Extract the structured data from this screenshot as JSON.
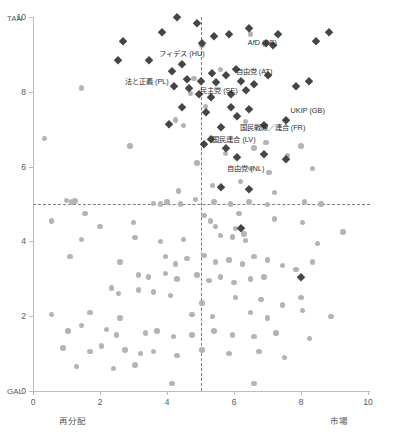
{
  "chart_data": {
    "type": "scatter",
    "title": "",
    "xlabel": "",
    "ylabel": "",
    "xlim": [
      0,
      10
    ],
    "ylim": [
      0,
      10
    ],
    "grid": false,
    "legend": "none",
    "axis_pole_labels": {
      "y_top": "TAN",
      "y_bottom": "GAL",
      "x_left": "再分配",
      "x_right": "市場"
    },
    "x_ticks": [
      "0",
      "2",
      "4",
      "6",
      "8",
      "10"
    ],
    "x_tick_values": [
      0,
      2,
      4,
      6,
      8,
      10
    ],
    "y_ticks": [
      "0",
      "2",
      "4",
      "6",
      "8",
      "10"
    ],
    "y_tick_values": [
      0,
      2,
      4,
      6,
      8,
      10
    ],
    "reference_lines": [
      {
        "orientation": "horizontal",
        "value": 5,
        "style": "dashed"
      },
      {
        "orientation": "vertical",
        "value": 5,
        "style": "dashed"
      }
    ],
    "colors": {
      "highlight_marker": "#454545",
      "background_marker": "#b4b4b4",
      "axis": "#bdbdbd",
      "reference_line": "#7d7d7d",
      "text": "#575757"
    },
    "series": [
      {
        "name": "背景政党",
        "marker": "circle",
        "color": "#b4b4b4",
        "points": [
          [
            0.35,
            6.75
          ],
          [
            1.45,
            8.1
          ],
          [
            5.05,
            9.25
          ],
          [
            6.5,
            9.55
          ],
          [
            4.8,
            8.35
          ],
          [
            4.7,
            7.95
          ],
          [
            5.6,
            8.6
          ],
          [
            5.15,
            7.6
          ],
          [
            4.25,
            7.25
          ],
          [
            4.5,
            7.1
          ],
          [
            6.35,
            7.2
          ],
          [
            6.95,
            6.65
          ],
          [
            6.6,
            6.5
          ],
          [
            5.75,
            6.35
          ],
          [
            4.9,
            6.1
          ],
          [
            6.5,
            5.95
          ],
          [
            7.05,
            5.85
          ],
          [
            6.2,
            5.6
          ],
          [
            5.35,
            5.5
          ],
          [
            7.6,
            6.3
          ],
          [
            8.0,
            6.55
          ],
          [
            8.35,
            5.95
          ],
          [
            7.2,
            5.3
          ],
          [
            1.0,
            5.1
          ],
          [
            1.15,
            5.05
          ],
          [
            1.25,
            5.08
          ],
          [
            3.6,
            5.02
          ],
          [
            3.8,
            5.0
          ],
          [
            4.0,
            5.05
          ],
          [
            4.4,
            5.0
          ],
          [
            4.85,
            5.12
          ],
          [
            5.4,
            5.05
          ],
          [
            5.9,
            5.0
          ],
          [
            6.45,
            5.05
          ],
          [
            7.0,
            4.98
          ],
          [
            8.1,
            5.05
          ],
          [
            8.6,
            5.0
          ],
          [
            1.55,
            4.75
          ],
          [
            0.55,
            4.55
          ],
          [
            2.0,
            4.4
          ],
          [
            3.0,
            4.5
          ],
          [
            5.1,
            4.7
          ],
          [
            5.3,
            4.55
          ],
          [
            5.45,
            4.4
          ],
          [
            6.15,
            4.75
          ],
          [
            6.05,
            4.35
          ],
          [
            6.3,
            4.2
          ],
          [
            7.2,
            4.6
          ],
          [
            8.05,
            4.5
          ],
          [
            1.45,
            4.05
          ],
          [
            3.8,
            4.0
          ],
          [
            4.5,
            4.05
          ],
          [
            5.6,
            4.15
          ],
          [
            5.95,
            4.12
          ],
          [
            6.35,
            4.02
          ],
          [
            8.5,
            3.95
          ],
          [
            9.25,
            4.25
          ],
          [
            1.1,
            3.6
          ],
          [
            2.6,
            3.45
          ],
          [
            3.95,
            3.6
          ],
          [
            4.25,
            3.4
          ],
          [
            4.6,
            3.55
          ],
          [
            5.1,
            3.62
          ],
          [
            5.45,
            3.45
          ],
          [
            5.85,
            3.5
          ],
          [
            6.25,
            3.4
          ],
          [
            6.6,
            3.6
          ],
          [
            7.0,
            3.5
          ],
          [
            7.45,
            3.35
          ],
          [
            7.85,
            3.25
          ],
          [
            8.35,
            3.45
          ],
          [
            3.15,
            3.1
          ],
          [
            3.45,
            3.05
          ],
          [
            3.95,
            3.15
          ],
          [
            4.3,
            3.0
          ],
          [
            4.9,
            3.1
          ],
          [
            5.25,
            2.95
          ],
          [
            5.6,
            3.05
          ],
          [
            6.0,
            2.9
          ],
          [
            6.5,
            3.0
          ],
          [
            2.35,
            2.75
          ],
          [
            2.55,
            2.6
          ],
          [
            3.15,
            2.7
          ],
          [
            3.6,
            2.65
          ],
          [
            4.1,
            2.55
          ],
          [
            6.05,
            2.5
          ],
          [
            6.8,
            2.45
          ],
          [
            7.45,
            2.3
          ],
          [
            8.0,
            2.5
          ],
          [
            0.55,
            2.05
          ],
          [
            1.7,
            2.1
          ],
          [
            2.6,
            1.95
          ],
          [
            4.75,
            2.05
          ],
          [
            5.35,
            2.0
          ],
          [
            6.5,
            2.1
          ],
          [
            7.0,
            1.95
          ],
          [
            8.05,
            2.15
          ],
          [
            8.9,
            2.0
          ],
          [
            1.05,
            1.6
          ],
          [
            1.45,
            1.75
          ],
          [
            2.2,
            1.65
          ],
          [
            2.5,
            1.5
          ],
          [
            3.35,
            1.55
          ],
          [
            3.7,
            1.6
          ],
          [
            4.2,
            1.45
          ],
          [
            4.75,
            1.5
          ],
          [
            5.4,
            1.6
          ],
          [
            5.95,
            1.5
          ],
          [
            6.6,
            1.45
          ],
          [
            7.25,
            1.55
          ],
          [
            8.25,
            1.4
          ],
          [
            0.9,
            1.15
          ],
          [
            1.7,
            1.05
          ],
          [
            2.05,
            1.2
          ],
          [
            2.75,
            1.1
          ],
          [
            3.2,
            1.0
          ],
          [
            3.6,
            1.05
          ],
          [
            4.3,
            0.95
          ],
          [
            5.05,
            1.1
          ],
          [
            5.85,
            1.0
          ],
          [
            6.75,
            1.05
          ],
          [
            7.5,
            0.9
          ],
          [
            1.3,
            0.65
          ],
          [
            2.4,
            0.6
          ],
          [
            3.05,
            0.7
          ],
          [
            4.15,
            0.2
          ],
          [
            6.6,
            0.2
          ],
          [
            2.9,
            6.55
          ],
          [
            4.35,
            5.35
          ],
          [
            5.05,
            2.35
          ],
          [
            3.05,
            4.1
          ],
          [
            6.9,
            3.05
          ]
        ]
      },
      {
        "name": "ポピュリスト右派政党",
        "marker": "diamond",
        "color": "#454545",
        "points": [
          [
            2.7,
            9.35
          ],
          [
            2.55,
            8.85
          ],
          [
            3.45,
            8.85
          ],
          [
            3.85,
            9.6
          ],
          [
            4.3,
            10.0
          ],
          [
            4.9,
            9.85
          ],
          [
            5.05,
            9.3
          ],
          [
            5.4,
            9.5
          ],
          [
            5.85,
            9.55
          ],
          [
            6.45,
            9.7
          ],
          [
            6.95,
            9.3
          ],
          [
            7.15,
            9.25
          ],
          [
            7.3,
            9.55
          ],
          [
            8.45,
            9.35
          ],
          [
            8.85,
            9.6
          ],
          [
            4.15,
            8.55
          ],
          [
            4.45,
            8.75
          ],
          [
            4.2,
            8.15
          ],
          [
            4.65,
            8.1
          ],
          [
            4.6,
            8.35
          ],
          [
            5.0,
            8.3
          ],
          [
            5.35,
            8.5
          ],
          [
            5.45,
            8.25
          ],
          [
            5.75,
            8.45
          ],
          [
            6.05,
            8.6
          ],
          [
            6.2,
            8.3
          ],
          [
            6.6,
            8.2
          ],
          [
            7.0,
            8.45
          ],
          [
            4.95,
            7.95
          ],
          [
            5.3,
            7.85
          ],
          [
            5.9,
            7.95
          ],
          [
            6.35,
            8.05
          ],
          [
            7.85,
            8.15
          ],
          [
            8.25,
            8.3
          ],
          [
            4.45,
            7.6
          ],
          [
            5.15,
            7.45
          ],
          [
            5.9,
            7.6
          ],
          [
            6.1,
            7.35
          ],
          [
            6.45,
            7.55
          ],
          [
            4.05,
            7.15
          ],
          [
            5.6,
            7.05
          ],
          [
            6.9,
            7.1
          ],
          [
            7.55,
            7.25
          ],
          [
            5.1,
            6.6
          ],
          [
            5.3,
            6.75
          ],
          [
            5.75,
            6.5
          ],
          [
            6.1,
            6.25
          ],
          [
            6.9,
            6.35
          ],
          [
            7.55,
            6.2
          ],
          [
            5.6,
            5.45
          ],
          [
            6.45,
            5.4
          ],
          [
            6.2,
            4.35
          ],
          [
            8.0,
            3.05
          ]
        ]
      }
    ],
    "annotations": [
      {
        "text": "フィデス (HU)",
        "x": 4.45,
        "y": 9.05
      },
      {
        "text": "法と正義 (PL)",
        "x": 3.4,
        "y": 8.3
      },
      {
        "text": "AfD (DE)",
        "x": 6.85,
        "y": 9.3
      },
      {
        "text": "自由党 (AT)",
        "x": 6.6,
        "y": 8.55
      },
      {
        "text": "民主党 (SE)",
        "x": 5.55,
        "y": 8.05
      },
      {
        "text": "UKIP (GB)",
        "x": 8.2,
        "y": 7.5
      },
      {
        "text": "国民戦線／連合 (FR)",
        "x": 7.15,
        "y": 7.05
      },
      {
        "text": "国民連合 (LV)",
        "x": 6.0,
        "y": 6.75
      },
      {
        "text": "自由党 (NL)",
        "x": 6.35,
        "y": 5.95
      }
    ]
  }
}
